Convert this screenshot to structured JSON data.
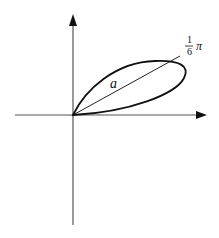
{
  "diagram": {
    "type": "polar-petal",
    "labels": {
      "petal_length": "a",
      "angle_numerator": "1",
      "angle_denominator": "6",
      "angle_symbol": "π"
    },
    "axes": {
      "horizontal": {
        "arrow": "right"
      },
      "vertical": {
        "arrow": "up"
      }
    },
    "colors": {
      "curve": "#111111",
      "axis": "#555555",
      "ray": "#222222",
      "background": "#ffffff"
    }
  }
}
